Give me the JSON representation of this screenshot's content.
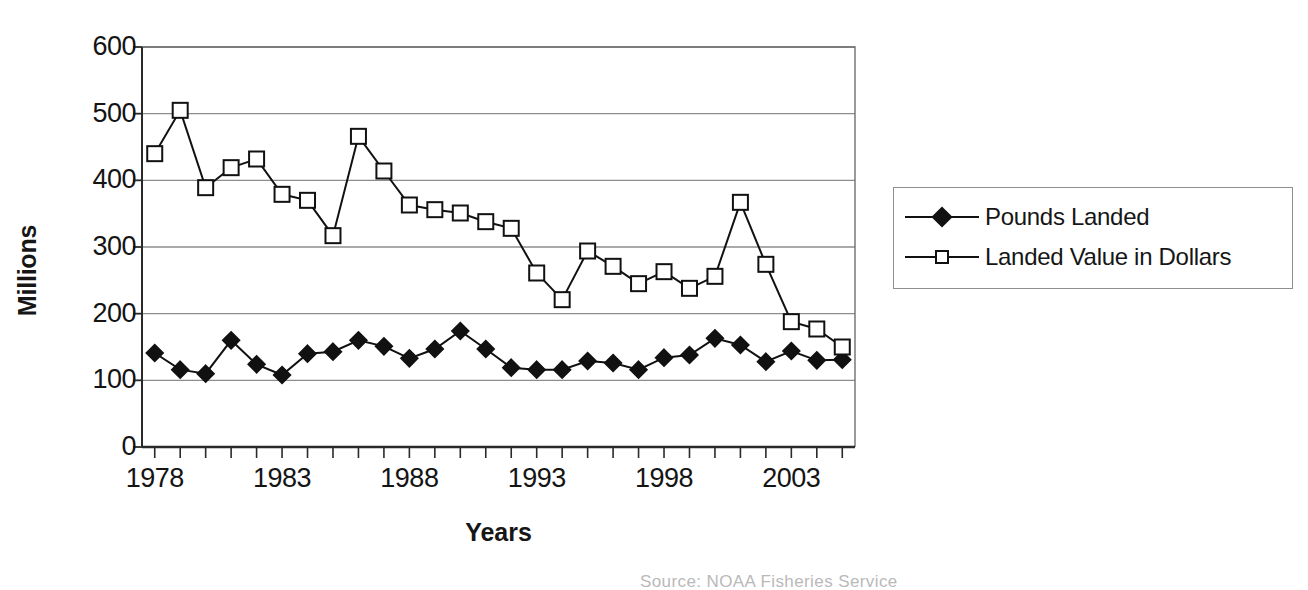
{
  "chart_data": {
    "type": "line",
    "title": "",
    "xlabel": "Years",
    "ylabel": "Millions",
    "xlim": [
      1977.5,
      2005.5
    ],
    "ylim": [
      0,
      600
    ],
    "y_ticks": [
      0,
      100,
      200,
      300,
      400,
      500,
      600
    ],
    "y_tick_labels": [
      "0",
      "100",
      "200",
      "300",
      "400",
      "500",
      "600"
    ],
    "x_ticks": [
      1978,
      1983,
      1988,
      1993,
      1998,
      2003
    ],
    "x_tick_labels": [
      "1978",
      "1983",
      "1988",
      "1993",
      "1998",
      "2003"
    ],
    "x": [
      1978,
      1979,
      1980,
      1981,
      1982,
      1983,
      1984,
      1985,
      1986,
      1987,
      1988,
      1989,
      1990,
      1991,
      1992,
      1993,
      1994,
      1995,
      1996,
      1997,
      1998,
      1999,
      2000,
      2001,
      2002,
      2003,
      2004,
      2005
    ],
    "grid": "horizontal",
    "legend_position": "right",
    "series": [
      {
        "name": "Pounds Landed",
        "marker": "filled-diamond",
        "color": "#111111",
        "values": [
          141,
          116,
          110,
          160,
          124,
          108,
          140,
          143,
          160,
          151,
          133,
          147,
          174,
          147,
          119,
          116,
          116,
          129,
          126,
          116,
          134,
          138,
          163,
          153,
          128,
          144,
          130,
          131
        ]
      },
      {
        "name": "Landed Value in Dollars",
        "marker": "open-square",
        "color": "#111111",
        "values": [
          440,
          505,
          389,
          419,
          432,
          379,
          370,
          317,
          466,
          414,
          363,
          356,
          351,
          338,
          328,
          261,
          221,
          294,
          271,
          245,
          263,
          238,
          256,
          367,
          274,
          188,
          177,
          150
        ]
      }
    ]
  },
  "axis": {
    "y_title": "Millions",
    "x_title": "Years"
  },
  "legend": {
    "items": [
      {
        "label": "Pounds Landed",
        "marker": "filled-diamond"
      },
      {
        "label": "Landed Value in Dollars",
        "marker": "open-square"
      }
    ]
  },
  "footer": {
    "source_note": "Source: NOAA Fisheries Service"
  }
}
